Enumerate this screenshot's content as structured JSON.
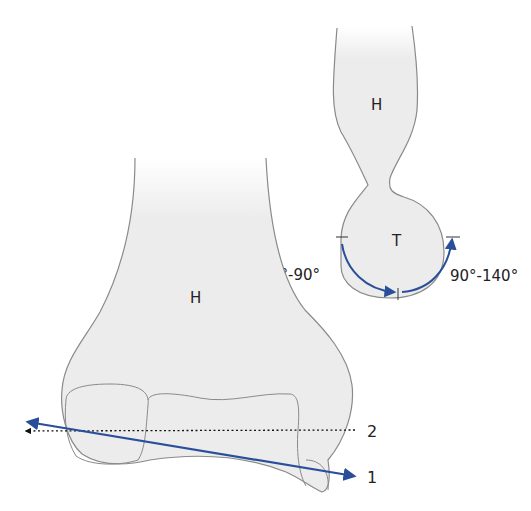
{
  "diagram": {
    "title": "",
    "colors": {
      "bone_fill": "#ececec",
      "outline": "#8a8a8a",
      "arrow": "#2a4f9a",
      "dotted": "#222222"
    },
    "lateral_view": {
      "shaft_label": "H",
      "trochlea_label": "T",
      "flexion_range_left": "0°-90°",
      "flexion_range_right": "90°-140°"
    },
    "frontal_view": {
      "shaft_label": "H",
      "axis_1_label": "1",
      "axis_2_label": "2"
    }
  }
}
